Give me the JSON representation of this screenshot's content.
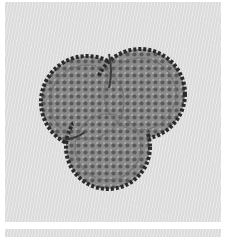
{
  "image": {
    "subject": "trilobed pollen grain micrograph",
    "colors": {
      "background": "#e3e3e3",
      "border": "#ffffff",
      "grain_fill": "#8a8a8a",
      "grain_outline": "#2a2a2a",
      "granule_light": "#b8b8b8",
      "granule_dark": "#555555"
    }
  }
}
